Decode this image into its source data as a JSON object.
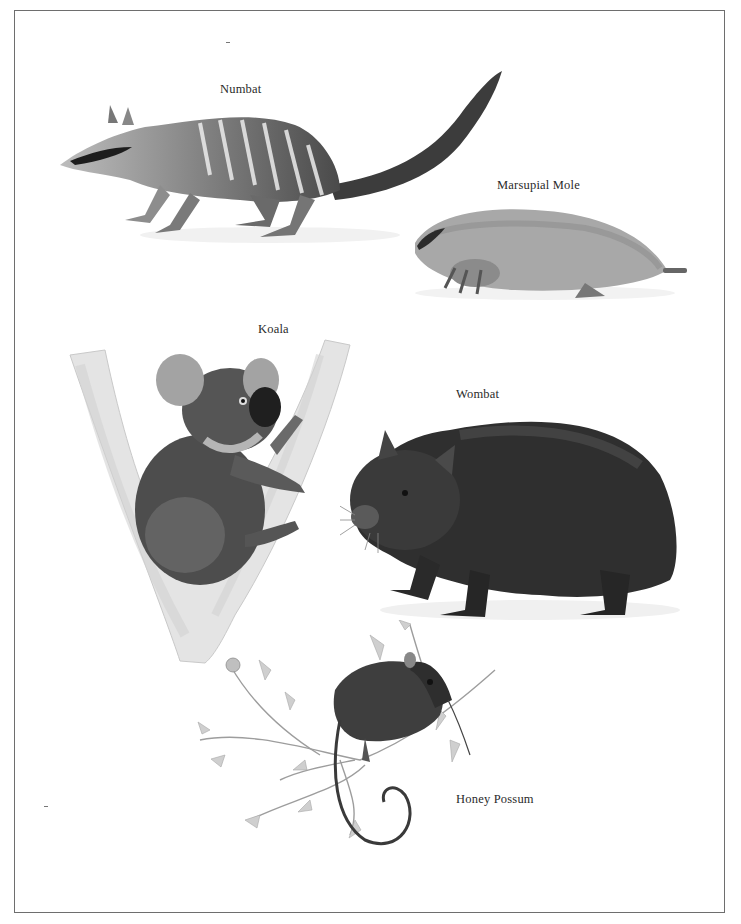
{
  "page": {
    "type": "illustrated plate",
    "theme": "Australian marsupials"
  },
  "captions": {
    "numbat": "Numbat",
    "marsupial_mole": "Marsupial Mole",
    "koala": "Koala",
    "wombat": "Wombat",
    "honey_possum": "Honey Possum"
  },
  "illustrations": [
    {
      "name": "numbat",
      "caption": "Numbat",
      "description": "striped numbat walking left with bushy raised tail"
    },
    {
      "name": "marsupial-mole",
      "caption": "Marsupial Mole",
      "description": "pale furry mole crouched, facing left"
    },
    {
      "name": "koala",
      "caption": "Koala",
      "description": "koala clinging in fork of pale eucalyptus trunk"
    },
    {
      "name": "wombat",
      "caption": "Wombat",
      "description": "dark shaggy wombat standing, facing left"
    },
    {
      "name": "honey-possum",
      "caption": "Honey Possum",
      "description": "small possum on flowering branch with curled tail"
    }
  ],
  "colors": {
    "background": "#ffffff",
    "border": "#6e6e6e",
    "text": "#2a2a2a"
  }
}
